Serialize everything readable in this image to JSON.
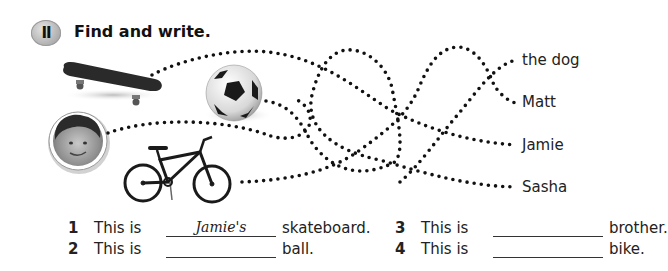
{
  "exercise": {
    "badge": "II",
    "title": "Find and write."
  },
  "names": [
    "the dog",
    "Matt",
    "Jamie",
    "Sasha"
  ],
  "pictures": [
    {
      "id": "skateboard",
      "label": "skateboard"
    },
    {
      "id": "ball",
      "label": "ball"
    },
    {
      "id": "boy",
      "label": "boy portrait"
    },
    {
      "id": "bike",
      "label": "bike"
    }
  ],
  "sentences": [
    {
      "num": "1",
      "prefix": "This is",
      "answer": "Jamie's",
      "suffix": "skateboard."
    },
    {
      "num": "2",
      "prefix": "This is",
      "answer": "",
      "suffix": "ball."
    },
    {
      "num": "3",
      "prefix": "This is",
      "answer": "",
      "suffix": "brother."
    },
    {
      "num": "4",
      "prefix": "This is",
      "answer": "",
      "suffix": "bike."
    }
  ]
}
